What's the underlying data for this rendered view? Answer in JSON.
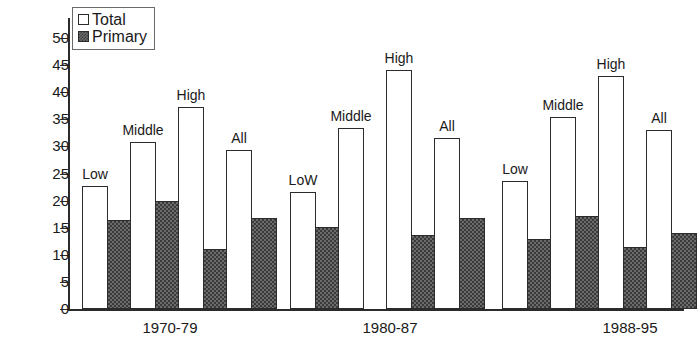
{
  "chart_data": {
    "type": "bar",
    "title": "",
    "xlabel": "",
    "ylabel": "",
    "ylim": [
      0,
      50
    ],
    "ytick_step": 5,
    "ytick_labels": [
      "0",
      "5",
      "10",
      "15",
      "20",
      "25",
      "30",
      "35",
      "40",
      "45",
      "50"
    ],
    "grid": false,
    "legend_position": "top-left",
    "legend": [
      "Total",
      "Primary"
    ],
    "categories": [
      "1970-79",
      "1980-87",
      "1988-95"
    ],
    "subcategories": [
      "Low",
      "Middle",
      "High",
      "All"
    ],
    "series": [
      {
        "name": "Total",
        "color": "#ffffff",
        "values": [
          [
            22.7,
            30.8,
            37.2,
            29.4
          ],
          [
            21.6,
            33.4,
            44.1,
            31.5
          ],
          [
            23.6,
            35.4,
            42.9,
            33.0
          ]
        ]
      },
      {
        "name": "Primary",
        "color": "#4a4a4a",
        "values": [
          [
            16.4,
            19.9,
            11.0,
            16.8
          ],
          [
            15.2,
            0.0,
            13.6,
            16.8
          ],
          [
            13.0,
            17.2,
            11.5,
            14.1
          ]
        ]
      }
    ]
  },
  "legend": {
    "total_label": "Total",
    "primary_label": "Primary"
  },
  "axis": {
    "ticks": [
      "50",
      "45",
      "40",
      "35",
      "30",
      "25",
      "20",
      "15",
      "10",
      "5",
      "0"
    ]
  },
  "groups": [
    {
      "label": "1970-79",
      "bars": [
        {
          "label": "Low",
          "total": 22.7,
          "primary": 16.4
        },
        {
          "label": "Middle",
          "total": 30.8,
          "primary": 19.9
        },
        {
          "label": "High",
          "total": 37.2,
          "primary": 11.0
        },
        {
          "label": "All",
          "total": 29.4,
          "primary": 16.8
        }
      ]
    },
    {
      "label": "1980-87",
      "bars": [
        {
          "label": "LoW",
          "total": 21.6,
          "primary": 15.2
        },
        {
          "label": "Middle",
          "total": 33.4,
          "primary": 0.0
        },
        {
          "label": "High",
          "total": 44.1,
          "primary": 13.6
        },
        {
          "label": "All",
          "total": 31.5,
          "primary": 16.8
        }
      ]
    },
    {
      "label": "1988-95",
      "bars": [
        {
          "label": "Low",
          "total": 23.6,
          "primary": 13.0
        },
        {
          "label": "Middle",
          "total": 35.4,
          "primary": 17.2
        },
        {
          "label": "High",
          "total": 42.9,
          "primary": 11.5
        },
        {
          "label": "All",
          "total": 33.0,
          "primary": 14.1
        }
      ]
    }
  ]
}
